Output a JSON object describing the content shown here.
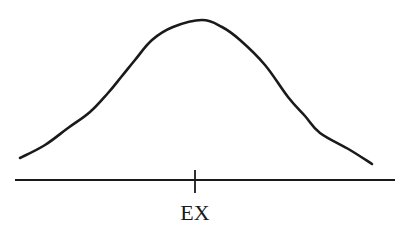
{
  "figure": {
    "axis_label": "EX",
    "colors": {
      "ink": "#1a1a1a",
      "background": "#ffffff"
    }
  },
  "chart_data": {
    "type": "line",
    "title": "",
    "xlabel": "",
    "ylabel": "",
    "tick_labels": [
      "EX"
    ],
    "annotations": [
      {
        "text": "EX",
        "position": "center tick on x-axis",
        "meaning": "expected value (mean)"
      }
    ],
    "grid": false,
    "legend": null,
    "curve_shape": "symmetric bell (normal-like density)",
    "pixel_points": [
      [
        20,
        158
      ],
      [
        45,
        145
      ],
      [
        68,
        128
      ],
      [
        90,
        112
      ],
      [
        108,
        93
      ],
      [
        122,
        76
      ],
      [
        135,
        60
      ],
      [
        152,
        40
      ],
      [
        173,
        27
      ],
      [
        202,
        20
      ],
      [
        222,
        27
      ],
      [
        240,
        40
      ],
      [
        265,
        65
      ],
      [
        288,
        97
      ],
      [
        305,
        116
      ],
      [
        320,
        133
      ],
      [
        350,
        150
      ],
      [
        372,
        164
      ]
    ],
    "axis": {
      "x_start": 15,
      "x_end": 395,
      "y": 180
    },
    "tick": {
      "x": 195,
      "y_top": 170,
      "y_bottom": 193
    }
  }
}
